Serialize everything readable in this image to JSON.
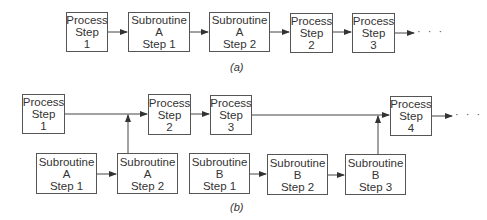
{
  "diagram_a": {
    "caption": "(a)",
    "continuation": "· · ·",
    "boxes": [
      {
        "id": "a-process-1",
        "lines": [
          "Process",
          "Step",
          "1"
        ]
      },
      {
        "id": "a-sub-a-1",
        "lines": [
          "Subroutine",
          "A",
          "Step 1"
        ]
      },
      {
        "id": "a-sub-a-2",
        "lines": [
          "Subroutine",
          "A",
          "Step 2"
        ]
      },
      {
        "id": "a-process-2",
        "lines": [
          "Process",
          "Step",
          "2"
        ]
      },
      {
        "id": "a-process-3",
        "lines": [
          "Process",
          "Step",
          "3"
        ]
      }
    ]
  },
  "diagram_b": {
    "caption": "(b)",
    "continuation": "· · ·",
    "boxes": [
      {
        "id": "b-process-1",
        "lines": [
          "Process",
          "Step",
          "1"
        ]
      },
      {
        "id": "b-process-2",
        "lines": [
          "Process",
          "Step",
          "2"
        ]
      },
      {
        "id": "b-process-3",
        "lines": [
          "Process",
          "Step",
          "3"
        ]
      },
      {
        "id": "b-process-4",
        "lines": [
          "Process",
          "Step",
          "4"
        ]
      },
      {
        "id": "b-sub-a-1",
        "lines": [
          "Subroutine",
          "A",
          "Step 1"
        ]
      },
      {
        "id": "b-sub-a-2",
        "lines": [
          "Subroutine",
          "A",
          "Step 2"
        ]
      },
      {
        "id": "b-sub-b-1",
        "lines": [
          "Subroutine",
          "B",
          "Step 1"
        ]
      },
      {
        "id": "b-sub-b-2",
        "lines": [
          "Subroutine",
          "B",
          "Step 2"
        ]
      },
      {
        "id": "b-sub-b-3",
        "lines": [
          "Subroutine",
          "B",
          "Step 3"
        ]
      }
    ]
  }
}
